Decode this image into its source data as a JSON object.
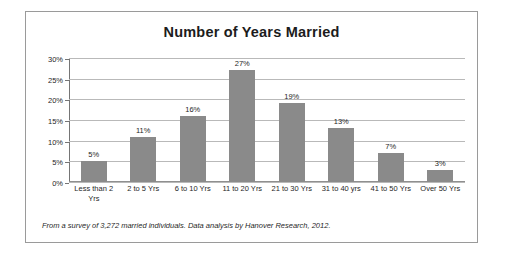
{
  "chart_data": {
    "type": "bar",
    "title": "Number of Years Married",
    "xlabel": "",
    "ylabel": "",
    "ylim": [
      0,
      30
    ],
    "ytick_labels": [
      "30%",
      "25%",
      "20%",
      "15%",
      "10%",
      "5%",
      "0%"
    ],
    "yticks": [
      30,
      25,
      20,
      15,
      10,
      5,
      0
    ],
    "grid": true,
    "legend": false,
    "categories": [
      "Less than 2 Yrs",
      "2 to 5 Yrs",
      "6 to 10 Yrs",
      "11 to 20 Yrs",
      "21 to 30 Yrs",
      "31 to 40 yrs",
      "41 to 50 Yrs",
      "Over  50 Yrs"
    ],
    "values": [
      5,
      11,
      16,
      27,
      19,
      13,
      7,
      3
    ],
    "value_labels": [
      "5%",
      "11%",
      "16%",
      "27%",
      "19%",
      "13%",
      "7%",
      "3%"
    ],
    "bar_color": "#8a8a8a",
    "annotation": "From a survey of 3,272 married individuals. Data analysis by Hanover Research, 2012."
  }
}
